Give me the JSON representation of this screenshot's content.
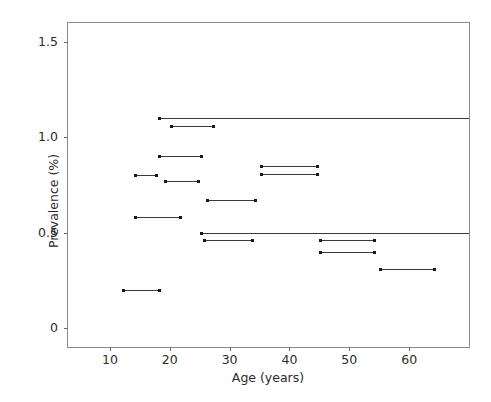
{
  "chart_data": {
    "type": "line",
    "title": "",
    "subtitle": "",
    "xlabel": "Age (years)",
    "ylabel": "Prevalence (%)",
    "xlim": [
      3,
      70
    ],
    "ylim": [
      -0.1,
      1.6
    ],
    "xticks": [
      10,
      20,
      30,
      40,
      50,
      60
    ],
    "xtick_labels": [
      "10",
      "20",
      "30",
      "40",
      "50",
      "60"
    ],
    "yticks": [
      0,
      0.5,
      1.0,
      1.5
    ],
    "ytick_labels": [
      "0",
      "0.5",
      "1.0",
      "1.5"
    ],
    "grid": false,
    "legend": false,
    "legend_position": "none",
    "marker": "square-endpoints",
    "series_color": "#3a3a3a",
    "segments": [
      {
        "x_start": 18.0,
        "x_end": 70.0,
        "y": 1.1
      },
      {
        "x_start": 20.0,
        "x_end": 27.5,
        "y": 1.06
      },
      {
        "x_start": 18.0,
        "x_end": 25.5,
        "y": 0.9
      },
      {
        "x_start": 14.0,
        "x_end": 18.0,
        "y": 0.8
      },
      {
        "x_start": 19.0,
        "x_end": 25.0,
        "y": 0.77
      },
      {
        "x_start": 35.0,
        "x_end": 45.0,
        "y": 0.85
      },
      {
        "x_start": 35.0,
        "x_end": 45.0,
        "y": 0.81
      },
      {
        "x_start": 26.0,
        "x_end": 34.5,
        "y": 0.67
      },
      {
        "x_start": 14.0,
        "x_end": 22.0,
        "y": 0.58
      },
      {
        "x_start": 25.0,
        "x_end": 70.0,
        "y": 0.5
      },
      {
        "x_start": 25.5,
        "x_end": 34.0,
        "y": 0.46
      },
      {
        "x_start": 45.0,
        "x_end": 54.5,
        "y": 0.46
      },
      {
        "x_start": 45.0,
        "x_end": 54.5,
        "y": 0.4
      },
      {
        "x_start": 55.0,
        "x_end": 64.5,
        "y": 0.31
      },
      {
        "x_start": 12.0,
        "x_end": 18.5,
        "y": 0.2
      }
    ]
  }
}
